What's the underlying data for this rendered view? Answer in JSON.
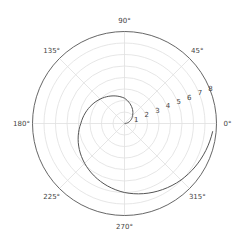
{
  "chart_data": {
    "type": "line",
    "projection": "polar",
    "title": "",
    "xlabel": "",
    "ylabel": "",
    "theta_tick_labels": [
      "0°",
      "45°",
      "90°",
      "135°",
      "180°",
      "225°",
      "270°",
      "315°"
    ],
    "theta_ticks_deg": [
      0,
      45,
      90,
      135,
      180,
      225,
      270,
      315
    ],
    "r_tick_labels": [
      "1",
      "2",
      "3",
      "4",
      "5",
      "6",
      "7",
      "8"
    ],
    "r_ticks": [
      1,
      2,
      3,
      4,
      5,
      6,
      7,
      8
    ],
    "rlim": [
      0,
      8
    ],
    "r_label_position_deg": 22.5,
    "grid": true,
    "legend": null,
    "series": [
      {
        "name": "spiral",
        "description": "Archimedean spiral r ≈ 1.25·θ (θ in radians)",
        "theta_deg": [
          0,
          45,
          90,
          135,
          180,
          225,
          270,
          315,
          355
        ],
        "r": [
          0.0,
          1.0,
          2.2,
          3.0,
          3.8,
          4.9,
          6.0,
          6.95,
          7.7
        ]
      }
    ]
  },
  "style": {
    "line_color": "#555555",
    "grid_color": "#e0e0e0",
    "spine_color": "#555555",
    "background": "#ffffff"
  }
}
